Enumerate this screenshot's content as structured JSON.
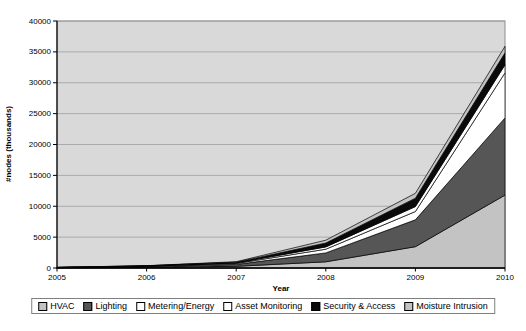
{
  "chart_data": {
    "type": "area",
    "stacked": true,
    "title": "",
    "xlabel": "Year",
    "ylabel": "#nodes (thousands)",
    "categories": [
      "2005",
      "2006",
      "2007",
      "2008",
      "2009",
      "2010"
    ],
    "ylim": [
      0,
      40000
    ],
    "y_ticks": [
      0,
      5000,
      10000,
      15000,
      20000,
      25000,
      30000,
      35000,
      40000
    ],
    "grid": true,
    "legend_position": "bottom",
    "plot_bg": "#d9d9d9",
    "gridline_color": "#9e9e9e",
    "axis_color": "#000000",
    "series": [
      {
        "name": "HVAC",
        "color": "#c3c3c3",
        "values": [
          30,
          100,
          280,
          1000,
          3450,
          11800
        ]
      },
      {
        "name": "Lighting",
        "color": "#565656",
        "values": [
          30,
          110,
          300,
          1450,
          4350,
          12500
        ]
      },
      {
        "name": "Metering/Energy",
        "color": "#ffffff",
        "values": [
          15,
          60,
          150,
          600,
          1350,
          7300
        ]
      },
      {
        "name": "Asset Monitoring",
        "color": "#ffffff",
        "values": [
          10,
          30,
          80,
          370,
          800,
          1300
        ]
      },
      {
        "name": "Security & Access",
        "color": "#0a0a0a",
        "values": [
          15,
          50,
          130,
          630,
          1350,
          1950
        ]
      },
      {
        "name": "Moisture Intrusion",
        "color": "#c3c3c3",
        "values": [
          10,
          30,
          80,
          450,
          800,
          1050
        ]
      }
    ]
  }
}
